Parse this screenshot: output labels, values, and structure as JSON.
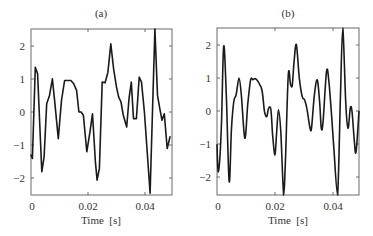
{
  "chart_data": [
    {
      "type": "line",
      "title": "(a)",
      "xlabel": "Time  [s]",
      "ylabel": "",
      "xlim": [
        0,
        0.0495
      ],
      "ylim": [
        -2.5,
        2.5
      ],
      "xticks": [
        0,
        0.02,
        0.04
      ],
      "xtick_labels": [
        "0",
        "0.02",
        "0.04"
      ],
      "yticks": [
        2,
        1,
        0,
        -1,
        -2
      ],
      "ytick_labels": [
        "2",
        "1",
        "0",
        "−1",
        "−2"
      ],
      "grid": false,
      "legend": null,
      "style": "piecewise-linear",
      "x": [
        0,
        0.0005,
        0.0015,
        0.0023,
        0.0038,
        0.0046,
        0.0055,
        0.0065,
        0.0075,
        0.0083,
        0.0096,
        0.0107,
        0.0118,
        0.013,
        0.014,
        0.015,
        0.016,
        0.0168,
        0.0176,
        0.0184,
        0.0196,
        0.0208,
        0.0216,
        0.0226,
        0.0232,
        0.024,
        0.025,
        0.026,
        0.027,
        0.028,
        0.029,
        0.03,
        0.0308,
        0.0316,
        0.0324,
        0.0336,
        0.0344,
        0.0352,
        0.036,
        0.037,
        0.038,
        0.0388,
        0.0398,
        0.0408,
        0.0418,
        0.0435,
        0.0444,
        0.0452,
        0.046,
        0.0468,
        0.0478,
        0.0488
      ],
      "y": [
        -1.3,
        -1.4,
        1.35,
        1.15,
        -1.8,
        -1.35,
        0.25,
        0.5,
        1.0,
        0.35,
        -0.8,
        0.35,
        0.95,
        0.95,
        0.95,
        0.85,
        0.65,
        0.0,
        0.0,
        -0.1,
        -1.2,
        -0.55,
        -0.05,
        -1.5,
        -2.05,
        -1.7,
        0.9,
        0.88,
        1.2,
        2.05,
        1.3,
        0.75,
        0.45,
        0.3,
        -0.1,
        -0.45,
        0.4,
        0.9,
        -0.2,
        -0.2,
        1.05,
        0.9,
        0.0,
        -1.2,
        -2.45,
        2.5,
        0.5,
        0.1,
        -0.25,
        -0.05,
        -1.1,
        -0.75
      ]
    },
    {
      "type": "line",
      "title": "(b)",
      "xlabel": "Time  [s]",
      "ylabel": "",
      "xlim": [
        0,
        0.049
      ],
      "ylim": [
        -2.5,
        2.5
      ],
      "xticks": [
        0,
        0.02,
        0.04
      ],
      "xtick_labels": [
        "0",
        "0.02",
        "0.04"
      ],
      "yticks": [
        2,
        1,
        0,
        -1,
        -2
      ],
      "ytick_labels": [
        "2",
        "1",
        "0",
        "−1",
        "−2"
      ],
      "grid": false,
      "legend": null,
      "style": "smooth",
      "x": [
        0,
        0.0005,
        0.0015,
        0.0023,
        0.0032,
        0.0042,
        0.005,
        0.0058,
        0.0066,
        0.0076,
        0.0084,
        0.0096,
        0.0106,
        0.0116,
        0.0124,
        0.0134,
        0.0148,
        0.0156,
        0.0164,
        0.0172,
        0.0178,
        0.0186,
        0.0192,
        0.02,
        0.0206,
        0.0212,
        0.022,
        0.023,
        0.0236,
        0.0246,
        0.0254,
        0.026,
        0.0266,
        0.0274,
        0.0284,
        0.0294,
        0.0302,
        0.031,
        0.032,
        0.0326,
        0.0336,
        0.0346,
        0.0354,
        0.036,
        0.0366,
        0.0378,
        0.0386,
        0.0396,
        0.0404,
        0.0416,
        0.0426,
        0.0434,
        0.0444,
        0.0452,
        0.046,
        0.0466,
        0.0474,
        0.048,
        0.049
      ],
      "y": [
        -1.0,
        -1.8,
        -0.5,
        1.95,
        0.5,
        -2.1,
        -0.5,
        0.3,
        0.5,
        1.0,
        0.5,
        -0.8,
        0.2,
        0.95,
        0.95,
        0.98,
        0.8,
        0.6,
        0.0,
        -0.15,
        0.1,
        0.05,
        -0.7,
        -1.3,
        -0.6,
        0.05,
        -0.6,
        -2.5,
        -1.5,
        1.1,
        0.8,
        0.8,
        1.5,
        2.0,
        1.0,
        0.45,
        0.35,
        0.1,
        -0.45,
        -0.5,
        0.5,
        0.95,
        0.3,
        -0.5,
        -0.3,
        1.2,
        0.9,
        -0.2,
        -1.2,
        -2.5,
        0.5,
        2.5,
        0.3,
        -0.5,
        0.1,
        0.0,
        -0.9,
        -1.2,
        0.0
      ]
    }
  ],
  "panels": [
    {
      "title": "(a)",
      "xlabel": "Time  [s]",
      "xtick_labels": [
        "0",
        "0.02",
        "0.04"
      ],
      "ytick_labels": [
        "2",
        "1",
        "0",
        "−1",
        "−2"
      ]
    },
    {
      "title": "(b)",
      "xlabel": "Time  [s]",
      "xtick_labels": [
        "0",
        "0.02",
        "0.04"
      ],
      "ytick_labels": [
        "2",
        "1",
        "0",
        "−1",
        "−2"
      ]
    }
  ],
  "colors": {
    "line": "#1a1a1a",
    "frame": "#6a6a6a",
    "text": "#333333",
    "background": "#ffffff"
  }
}
